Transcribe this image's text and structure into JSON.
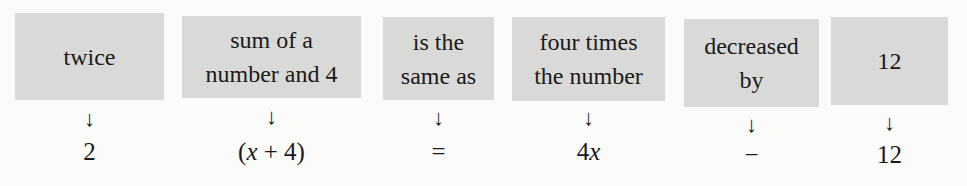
{
  "translation": {
    "arrow_glyph": "↓",
    "items": [
      {
        "phrase_lines": [
          "twice"
        ],
        "expression": "2"
      },
      {
        "phrase_lines": [
          "sum of a",
          "number and 4"
        ],
        "expression_parts": [
          "(",
          "x",
          " + 4)"
        ]
      },
      {
        "phrase_lines": [
          "is the",
          "same as"
        ],
        "expression": "="
      },
      {
        "phrase_lines": [
          "four times",
          "the number"
        ],
        "expression_parts": [
          "4",
          "x"
        ]
      },
      {
        "phrase_lines": [
          "decreased",
          "by"
        ],
        "expression": "−"
      },
      {
        "phrase_lines": [
          "12"
        ],
        "expression": "12"
      }
    ]
  },
  "colors": {
    "box_fill": "#d9d9d8",
    "text": "#1a1a1a",
    "background": "#fbfbfa"
  }
}
